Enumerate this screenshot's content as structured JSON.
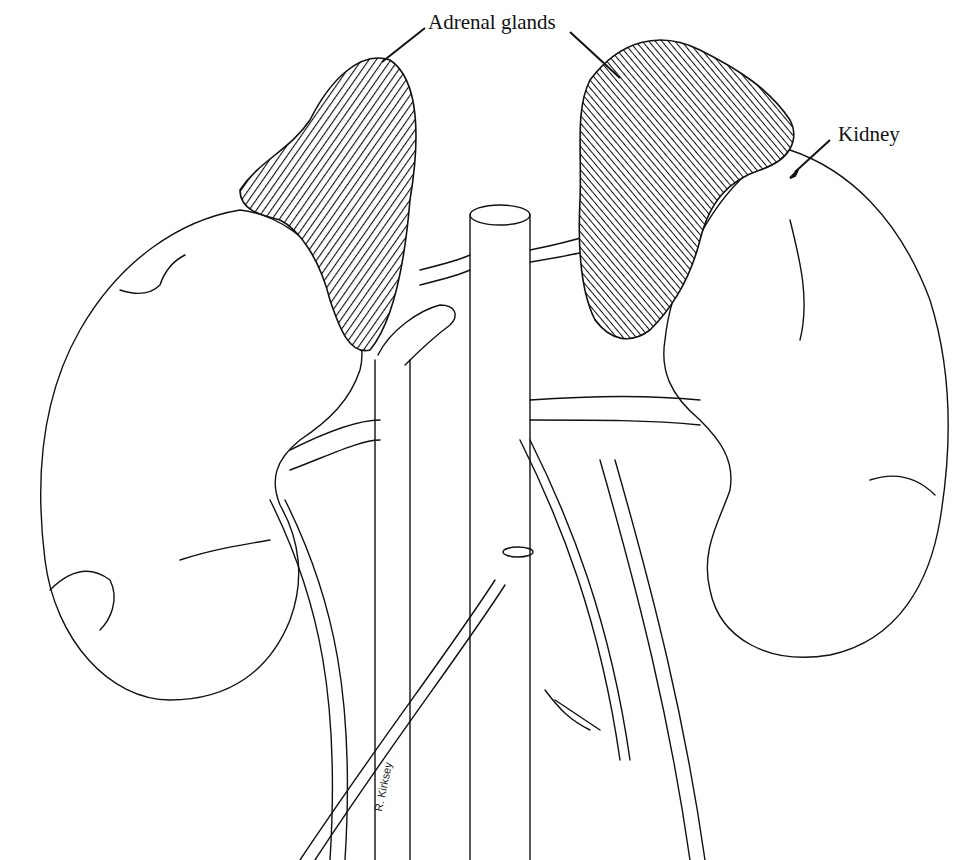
{
  "figure": {
    "labels": {
      "adrenal_glands": "Adrenal glands",
      "kidney": "Kidney"
    },
    "signature": "R. Kirksey"
  }
}
